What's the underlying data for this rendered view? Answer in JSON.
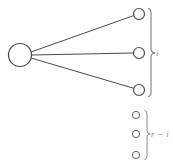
{
  "figure": {
    "type": "node-link-diagram",
    "background_color": "#fefefe",
    "stroke_color": "#4a4a4a",
    "label_color": "#8d8d8d",
    "width": 173,
    "height": 168,
    "hub_node": {
      "name": "hub-node",
      "cx": 20,
      "cy": 55,
      "r": 11.5,
      "filled": false
    },
    "connected_nodes": [
      {
        "name": "connected-node-1",
        "cx": 139,
        "cy": 14,
        "r": 5.5
      },
      {
        "name": "connected-node-2",
        "cx": 139,
        "cy": 53,
        "r": 5.5
      },
      {
        "name": "connected-node-3",
        "cx": 139,
        "cy": 90,
        "r": 5.5
      }
    ],
    "unconnected_nodes": [
      {
        "name": "unconnected-node-1",
        "cx": 136,
        "cy": 115,
        "r": 3.6
      },
      {
        "name": "unconnected-node-2",
        "cx": 136,
        "cy": 134,
        "r": 3.6
      },
      {
        "name": "unconnected-node-3",
        "cx": 136,
        "cy": 155,
        "r": 3.6
      }
    ],
    "edges": [
      {
        "name": "edge-hub-to-node-1",
        "x1": 31,
        "y1": 52,
        "x2": 133.7,
        "y2": 15.6
      },
      {
        "name": "edge-hub-to-node-2",
        "x1": 31.5,
        "y1": 55,
        "x2": 133.5,
        "y2": 53
      },
      {
        "name": "edge-hub-to-node-3",
        "x1": 31,
        "y1": 58,
        "x2": 133.8,
        "y2": 88.3
      }
    ],
    "braces": [
      {
        "name": "brace-connected",
        "x": 151,
        "y_top": 8,
        "y_bottom": 97,
        "tip_x": 156,
        "tip_y": 53
      },
      {
        "name": "brace-unconnected",
        "x": 147,
        "y_top": 110,
        "y_bottom": 160,
        "tip_x": 151,
        "tip_y": 134
      }
    ]
  },
  "labels": {
    "connected_group": "i",
    "unconnected_group": "r − i"
  }
}
